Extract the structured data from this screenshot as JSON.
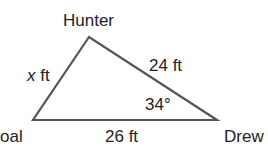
{
  "diagram": {
    "type": "triangle",
    "vertices": {
      "top": "Hunter",
      "left": "Goal",
      "right": "Drew"
    },
    "vertex_labels": {
      "top": "Hunter",
      "left": "oal",
      "right": "Drew"
    },
    "sides": {
      "left": {
        "var": "x",
        "unit": " ft"
      },
      "right": "24 ft",
      "bottom": "26 ft"
    },
    "angle": "34°",
    "line_color": "#555555"
  }
}
